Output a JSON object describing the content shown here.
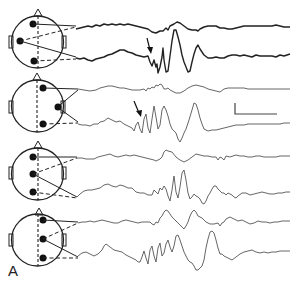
{
  "figure": {
    "panel_label": "A",
    "montages": [
      {
        "index": 1,
        "electrodes": [
          "frontal-left",
          "temporal-left",
          "occipital-left"
        ],
        "arrow_on_trace": 2
      },
      {
        "index": 2,
        "electrodes": [
          "frontal-right",
          "temporal-right",
          "occipital-right"
        ],
        "arrow_on_trace": 2
      },
      {
        "index": 3,
        "electrodes": [
          "frontal-left-mid",
          "central-left-mid",
          "occipital-left-mid"
        ],
        "arrow_on_trace": null
      },
      {
        "index": 4,
        "electrodes": [
          "frontal-right-mid",
          "central-right-mid",
          "occipital-right-mid"
        ],
        "arrow_on_trace": null
      }
    ],
    "traces_per_montage": 2,
    "scale_bar": {
      "orientation": "L-shaped",
      "vertical_unit": "",
      "horizontal_unit": ""
    },
    "colors": {
      "ink": "#222222",
      "trace": "#555555",
      "background": "#ffffff"
    }
  }
}
